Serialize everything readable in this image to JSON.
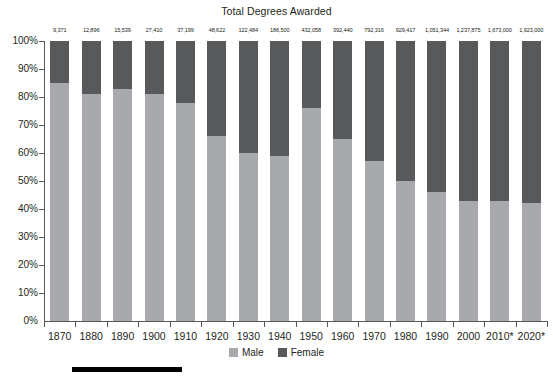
{
  "chart": {
    "title": "Total Degrees Awarded",
    "ylabel": "",
    "xlabel": ""
  },
  "legend": {
    "items": [
      {
        "label": "Male",
        "color": "#a7a9ac"
      },
      {
        "label": "Female",
        "color": "#58595b"
      }
    ]
  },
  "yaxis": {
    "ticks": [
      "100%",
      "90%",
      "80%",
      "70%",
      "60%",
      "50%",
      "40%",
      "30%",
      "20%",
      "10%",
      "0%"
    ]
  },
  "chart_data": {
    "type": "bar",
    "subtype": "stacked-100-percent",
    "title": "Total Degrees Awarded",
    "xlabel": "",
    "ylabel": "",
    "ylim": [
      0,
      100
    ],
    "grid": false,
    "legend_position": "bottom",
    "categories": [
      "1870",
      "1880",
      "1890",
      "1900",
      "1910",
      "1920",
      "1930",
      "1940",
      "1950",
      "1960",
      "1970",
      "1980",
      "1990",
      "2000",
      "2010*",
      "2020*"
    ],
    "series": [
      {
        "name": "Male",
        "color": "#a7a9ac",
        "values": [
          85,
          81,
          83,
          81,
          78,
          66,
          60,
          59,
          76,
          65,
          57,
          50,
          46,
          43,
          43,
          42
        ]
      },
      {
        "name": "Female",
        "color": "#58595b",
        "values": [
          15,
          19,
          17,
          19,
          22,
          34,
          40,
          41,
          24,
          35,
          43,
          50,
          54,
          57,
          57,
          58
        ]
      }
    ],
    "data_labels": {
      "name": "Total Degrees Awarded",
      "values": [
        "9,371",
        "12,896",
        "15,539",
        "27,410",
        "37,199",
        "48,622",
        "122,484",
        "186,500",
        "432,058",
        "392,440",
        "792,316",
        "929,417",
        "1,051,344",
        "1,237,875",
        "1,673,000",
        "1,923,000"
      ]
    }
  }
}
